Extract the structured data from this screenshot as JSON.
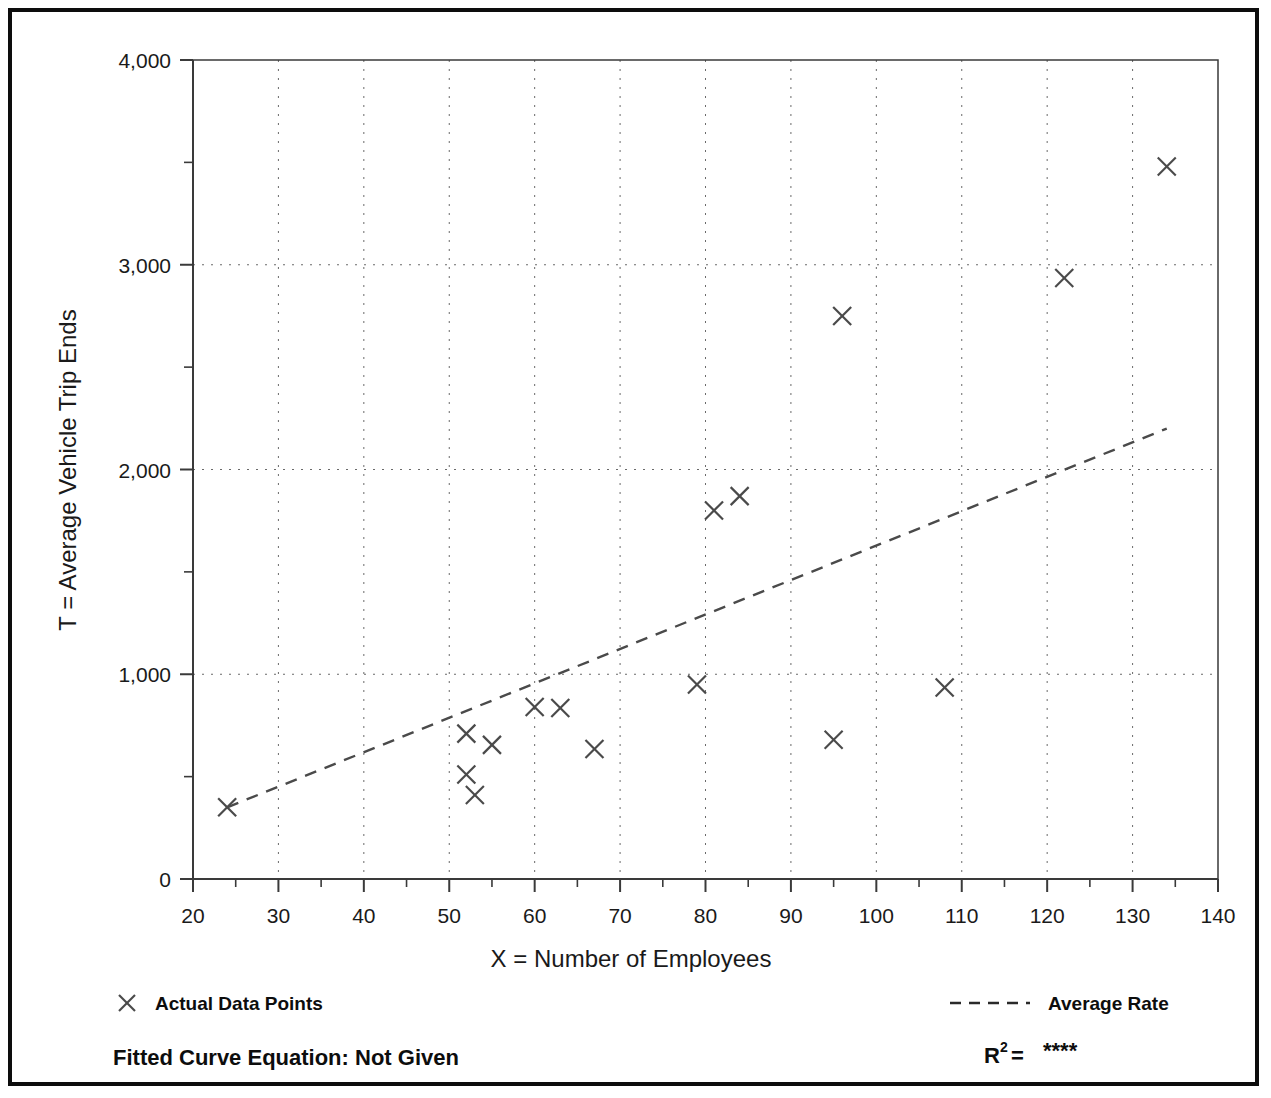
{
  "chart_data": {
    "type": "scatter",
    "title": "",
    "xlabel": "X = Number of Employees",
    "ylabel": "T = Average Vehicle Trip Ends",
    "xlim": [
      20,
      140
    ],
    "ylim": [
      0,
      4000
    ],
    "x_ticks": [
      20,
      30,
      40,
      50,
      60,
      70,
      80,
      90,
      100,
      110,
      120,
      130,
      140
    ],
    "x_tick_labels": [
      "20",
      "30",
      "40",
      "50",
      "60",
      "70",
      "80",
      "90",
      "100",
      "110",
      "120",
      "130",
      "140"
    ],
    "x_minor_step": 5,
    "y_ticks": [
      0,
      1000,
      2000,
      3000,
      4000
    ],
    "y_tick_labels": [
      "0",
      "1,000",
      "2,000",
      "3,000",
      "4,000"
    ],
    "y_minor_step": 500,
    "grid": "dotted vertical at every major x tick; dotted horizontal at 1,000 / 2,000 / 3,000",
    "legend_position": "below-plot",
    "series": [
      {
        "name": "Actual Data Points",
        "marker": "x",
        "points": [
          {
            "x": 24,
            "y": 350
          },
          {
            "x": 52,
            "y": 710
          },
          {
            "x": 55,
            "y": 655
          },
          {
            "x": 52,
            "y": 510
          },
          {
            "x": 53,
            "y": 410
          },
          {
            "x": 60,
            "y": 840
          },
          {
            "x": 63,
            "y": 835
          },
          {
            "x": 67,
            "y": 635
          },
          {
            "x": 79,
            "y": 950
          },
          {
            "x": 81,
            "y": 1800
          },
          {
            "x": 84,
            "y": 1870
          },
          {
            "x": 95,
            "y": 680
          },
          {
            "x": 96,
            "y": 2750
          },
          {
            "x": 108,
            "y": 935
          },
          {
            "x": 122,
            "y": 2935
          },
          {
            "x": 134,
            "y": 3480
          }
        ]
      },
      {
        "name": "Average Rate",
        "marker": "dashed-line",
        "line": [
          {
            "x": 24,
            "y": 350
          },
          {
            "x": 134,
            "y": 2200
          }
        ]
      }
    ],
    "annotations": [
      "Fitted Curve Equation:  Not Given",
      "R2 = ****"
    ]
  },
  "legend": {
    "data_points_label": "Actual Data Points",
    "average_rate_label": "Average Rate",
    "data_points_icon": "x-marker-icon",
    "average_rate_icon": "dashed-line-icon"
  },
  "footer": {
    "fitted_curve_label": "Fitted Curve Equation:  Not Given",
    "r_squared_base": "R",
    "r_squared_exponent": "2",
    "r_squared_equals": " = ",
    "r_squared_value": "****"
  },
  "colors": {
    "frame": "#0d0d0d",
    "axis": "#3a3a3a",
    "grid": "#6a6a6a",
    "marker": "#4a4a4a",
    "text": "#1a1a1a",
    "background": "#ffffff"
  }
}
